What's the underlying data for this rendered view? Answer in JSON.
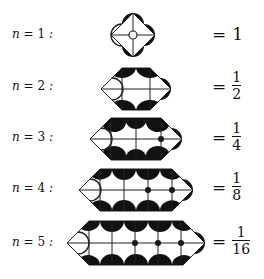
{
  "rows": [
    {
      "n_label": "n = 1 :",
      "n": "1",
      "result": "1",
      "numerator": "",
      "denominator": "",
      "is_fraction": false,
      "black_dots": 0
    },
    {
      "n_label": "n = 2 :",
      "n": "2",
      "result": "1/2",
      "numerator": "1",
      "denominator": "2",
      "is_fraction": true,
      "black_dots": 0
    },
    {
      "n_label": "n = 3 :",
      "n": "3",
      "result": "1/4",
      "numerator": "1",
      "denominator": "4",
      "is_fraction": true,
      "black_dots": 1
    },
    {
      "n_label": "n = 4 :",
      "n": "4",
      "result": "1/8",
      "numerator": "1",
      "denominator": "8",
      "is_fraction": true,
      "black_dots": 2
    },
    {
      "n_label": "n = 5 :",
      "n": "5",
      "result": "1/16",
      "numerator": "1",
      "denominator": "16",
      "is_fraction": true,
      "black_dots": 3
    }
  ],
  "symbols": {
    "n_var": "n",
    "equals": "=",
    "colon": ":"
  },
  "colors": {
    "fill": "#111111",
    "stroke": "#222222",
    "background": "#ffffff"
  }
}
